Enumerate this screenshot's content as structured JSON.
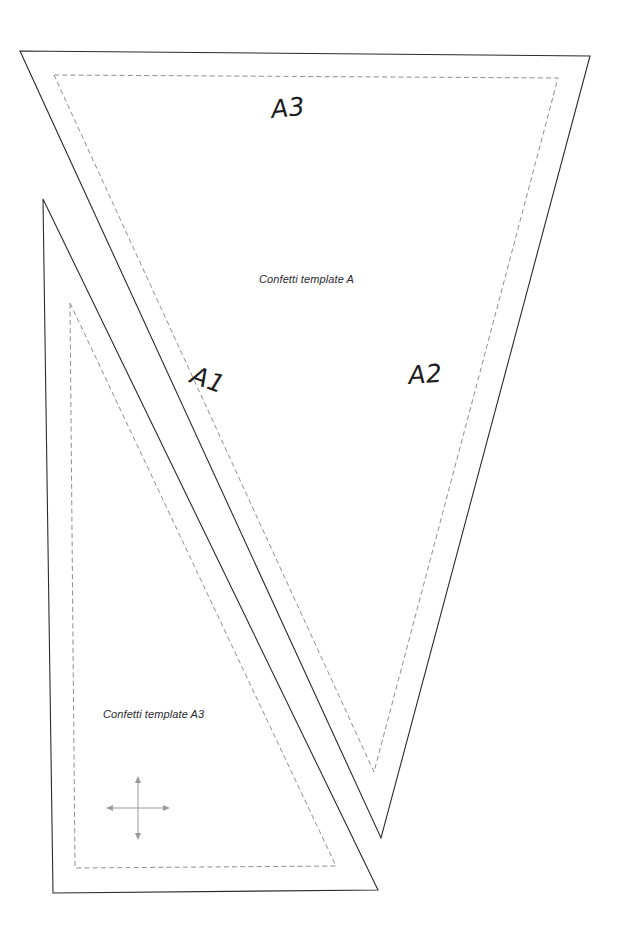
{
  "document": {
    "title": "Confetti template A",
    "background_color": "#ffffff",
    "cut_line_color": "#2b2b2f",
    "seam_line_color": "#8e8e95",
    "width": 620,
    "height": 939
  },
  "labels": {
    "piece_a3": "A3",
    "piece_a1": "A1",
    "piece_a2": "A2",
    "caption_a": "Confetti template A",
    "caption_a3": "Confetti template A3"
  },
  "pieces": [
    {
      "id": "template-a",
      "name": "Confetti template A",
      "cut_outline": "20,51 590,56 381,838",
      "seam_outline": "54,75 558,78 374,772"
    },
    {
      "id": "template-a3",
      "name": "Confetti template A3",
      "cut_outline": "43,199 378,890 53,893",
      "seam_outline": "70,303 336,866 75,868"
    }
  ],
  "grain_marker": {
    "name": "four-way stretch direction marker",
    "center_x": 138,
    "center_y": 808,
    "arm_length": 30,
    "color": "#9a9aa0"
  }
}
